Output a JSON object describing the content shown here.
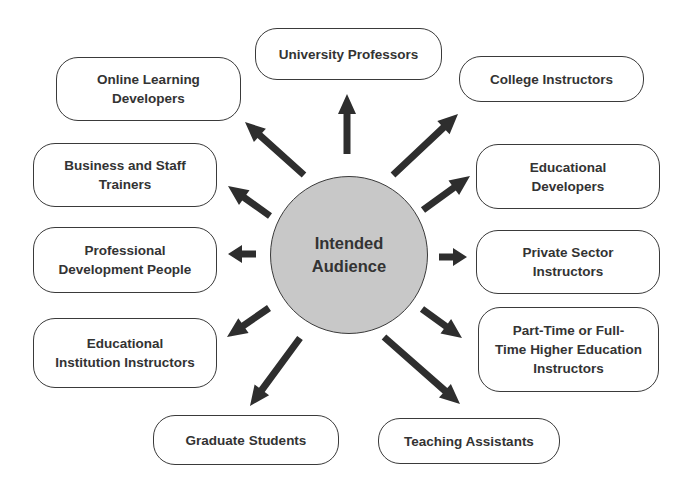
{
  "diagram": {
    "type": "hub-and-spoke",
    "center": {
      "label": "Intended\nAudience",
      "fill": "#c8c8c8"
    },
    "colors": {
      "stroke": "#3a3a3a",
      "text": "#333333",
      "arrow": "#2e2e2e",
      "background": "#ffffff"
    },
    "nodes": [
      {
        "id": "university-professors",
        "label": "University Professors",
        "box": [
          255,
          28,
          187,
          52
        ],
        "arrow": [
          347,
          154,
          347,
          94
        ]
      },
      {
        "id": "college-instructors",
        "label": "College Instructors",
        "box": [
          459,
          56,
          185,
          46
        ],
        "arrow": [
          393,
          175,
          458,
          114
        ]
      },
      {
        "id": "educational-developers",
        "label": "Educational\nDevelopers",
        "box": [
          476,
          144,
          184,
          65
        ],
        "arrow": [
          423,
          210,
          470,
          176
        ]
      },
      {
        "id": "private-sector-instructors",
        "label": "Private Sector\nInstructors",
        "box": [
          476,
          230,
          184,
          64
        ],
        "arrow": [
          439,
          257,
          467,
          257
        ]
      },
      {
        "id": "part-time-full-time-higher-ed-instructors",
        "label": "Part-Time or Full-\nTime Higher Education\nInstructors",
        "box": [
          478,
          307,
          181,
          85
        ],
        "arrow": [
          422,
          309,
          462,
          338
        ]
      },
      {
        "id": "teaching-assistants",
        "label": "Teaching Assistants",
        "box": [
          378,
          418,
          182,
          46
        ],
        "arrow": [
          384,
          337,
          460,
          404
        ]
      },
      {
        "id": "graduate-students",
        "label": "Graduate Students",
        "box": [
          153,
          415,
          186,
          50
        ],
        "arrow": [
          300,
          338,
          250,
          406
        ]
      },
      {
        "id": "educational-institution-instructors",
        "label": "Educational\nInstitution Instructors",
        "box": [
          33,
          318,
          184,
          70
        ],
        "arrow": [
          269,
          308,
          227,
          337
        ]
      },
      {
        "id": "professional-development-people",
        "label": "Professional\nDevelopment People",
        "box": [
          33,
          227,
          184,
          66
        ],
        "arrow": [
          256,
          254,
          228,
          254
        ]
      },
      {
        "id": "business-and-staff-trainers",
        "label": "Business and Staff\nTrainers",
        "box": [
          33,
          143,
          184,
          64
        ],
        "arrow": [
          270,
          216,
          228,
          186
        ]
      },
      {
        "id": "online-learning-developers",
        "label": "Online Learning\nDevelopers",
        "box": [
          56,
          57,
          185,
          64
        ],
        "arrow": [
          304,
          175,
          245,
          122
        ]
      }
    ]
  }
}
